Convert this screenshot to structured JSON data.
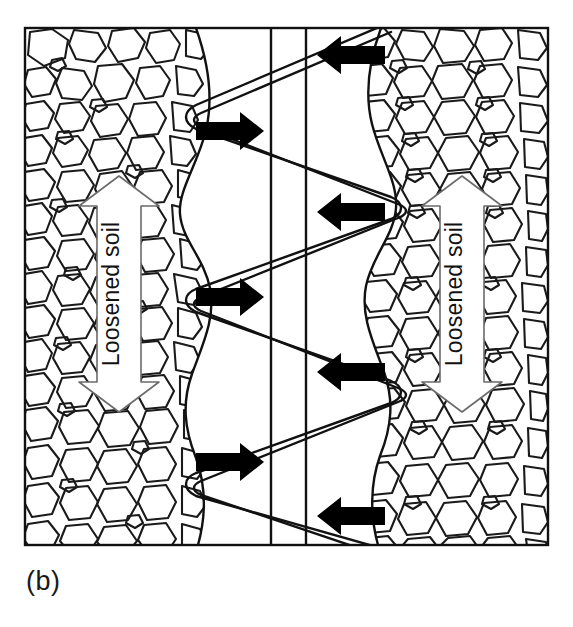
{
  "figure": {
    "caption": "(b)",
    "panel_id": "b",
    "type": "cross-section-diagram",
    "background_color": "#ffffff",
    "line_color": "#111111",
    "arrow_fill": "#000000",
    "soil_fill": "#ffffff"
  },
  "frame": {
    "x": 25,
    "y": 28,
    "width": 523,
    "height": 517,
    "stroke_width": 2
  },
  "labels": {
    "left_soil": "Loosened soil",
    "right_soil": "Loosened soil"
  },
  "soil_zones": [
    {
      "name": "left-loosened-soil",
      "side": "left",
      "label": "Loosened soil"
    },
    {
      "name": "right-loosened-soil",
      "side": "right",
      "label": "Loosened soil"
    }
  ],
  "label_arrows": [
    {
      "name": "left-extent-arrow",
      "label": "Loosened soil",
      "direction": "double-vertical",
      "cx": 119,
      "top": 176,
      "bottom": 412,
      "shaft_half_width": 22,
      "head_half_width": 40,
      "head_length": 28
    },
    {
      "name": "right-extent-arrow",
      "label": "Loosened soil",
      "direction": "double-vertical",
      "cx": 462,
      "top": 176,
      "bottom": 412,
      "shaft_half_width": 22,
      "head_half_width": 40,
      "head_length": 28
    }
  ],
  "force_arrows": {
    "left_side_direction": "right",
    "right_side_direction": "left",
    "left": [
      {
        "name": "force-arrow-left-1",
        "y": 131,
        "tail_x": 196,
        "tip_x": 262
      },
      {
        "name": "force-arrow-left-2",
        "y": 297,
        "tail_x": 196,
        "tip_x": 262
      },
      {
        "name": "force-arrow-left-3",
        "y": 462,
        "tail_x": 196,
        "tip_x": 262
      }
    ],
    "right": [
      {
        "name": "force-arrow-right-1",
        "y": 55,
        "tail_x": 385,
        "tip_x": 317
      },
      {
        "name": "force-arrow-right-2",
        "y": 212,
        "tail_x": 385,
        "tip_x": 317
      },
      {
        "name": "force-arrow-right-3",
        "y": 372,
        "tail_x": 385,
        "tip_x": 317
      },
      {
        "name": "force-arrow-right-4",
        "y": 516,
        "tail_x": 385,
        "tip_x": 317
      }
    ],
    "count_left": 3,
    "count_right": 4
  },
  "tine": {
    "name": "zigzag-tine",
    "description": "Double-line zigzag tine path with rounded vertices",
    "left_vertex_x": 186,
    "right_vertex_x": 391,
    "ribbon_offset": 7,
    "vertices_y": [
      28,
      112,
      196,
      281,
      365,
      449,
      533
    ],
    "vertex_sides": [
      "right",
      "left",
      "right",
      "left",
      "right",
      "left",
      "right"
    ]
  },
  "channel": {
    "name": "central-channel",
    "left_line_x": 271,
    "right_line_x": 306,
    "top": 28,
    "bottom": 545
  },
  "soil_boundaries": {
    "left_curve_mean_x": 196,
    "right_curve_mean_x": 381,
    "scallop_count": 3,
    "scallop_amplitude": 22
  }
}
